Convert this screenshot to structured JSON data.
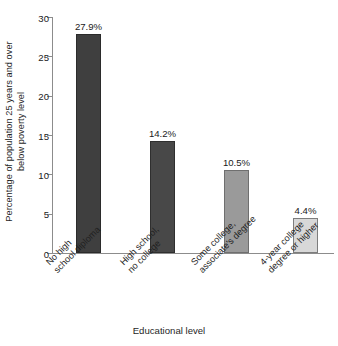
{
  "chart_data": {
    "type": "bar",
    "title": "",
    "xlabel": "Educational level",
    "ylabel": "Percentage of population 25 years and over below poverty level",
    "ylabel_line1": "Percentage of population 25 years and over",
    "ylabel_line2": "below poverty level",
    "categories": [
      "No high school diploma",
      "High school, no college",
      "Some college, associate's degree",
      "4-year college degree or higher"
    ],
    "category_lines": [
      [
        "No high",
        "school diploma"
      ],
      [
        "High school,",
        "no college"
      ],
      [
        "Some college,",
        "associate's degree"
      ],
      [
        "4-year college",
        "degree or higher"
      ]
    ],
    "values": [
      27.9,
      14.2,
      10.5,
      4.4
    ],
    "value_labels": [
      "27.9%",
      "14.2%",
      "10.5%",
      "4.4%"
    ],
    "bar_colors": [
      "#3f3f3f",
      "#484848",
      "#9a9a9a",
      "#d8d8d8"
    ],
    "bar_border_colors": [
      "#2b2b2b",
      "#2f2f2f",
      "#6f6f6f",
      "#7d7d7d"
    ],
    "ylim": [
      0,
      30
    ],
    "yticks": [
      0,
      5,
      10,
      15,
      20,
      25,
      30
    ],
    "ytick_labels": [
      "0",
      "5",
      "10",
      "15",
      "20",
      "25",
      "30"
    ],
    "grid": false,
    "legend": "none",
    "axis_color": "#8c8c8c"
  }
}
